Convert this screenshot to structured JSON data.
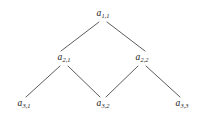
{
  "figure": {
    "type": "lattice-diagram",
    "background_color": "#ffffff",
    "edge_color": "#4a4a4a",
    "label_color": "#1a1a1a",
    "width": 203,
    "height": 131
  },
  "nodes": [
    {
      "id": "a-1-1",
      "base": "a",
      "subscript": "1,1",
      "level": 1,
      "x": 103,
      "y": 14
    },
    {
      "id": "a-2-1",
      "base": "a",
      "subscript": "2,1",
      "level": 2,
      "x": 64,
      "y": 58
    },
    {
      "id": "a-2-2",
      "base": "a",
      "subscript": "2,2",
      "level": 2,
      "x": 142,
      "y": 58
    },
    {
      "id": "a-3-1",
      "base": "a",
      "subscript": "3,1",
      "level": 3,
      "x": 24,
      "y": 104
    },
    {
      "id": "a-3-2",
      "base": "a",
      "subscript": "3,2",
      "level": 3,
      "x": 103,
      "y": 104
    },
    {
      "id": "a-3-3",
      "base": "a",
      "subscript": "3,3",
      "level": 3,
      "x": 182,
      "y": 104
    }
  ],
  "edges": [
    {
      "id": "edge-a11-a21",
      "from": "a-1-1",
      "to": "a-2-1",
      "x1": 99,
      "y1": 22,
      "x2": 61,
      "y2": 51
    },
    {
      "id": "edge-a11-a22",
      "from": "a-1-1",
      "to": "a-2-2",
      "x1": 107,
      "y1": 22,
      "x2": 145,
      "y2": 51
    },
    {
      "id": "edge-a21-a31",
      "from": "a-2-1",
      "to": "a-3-1",
      "x1": 60,
      "y1": 66,
      "x2": 26,
      "y2": 97
    },
    {
      "id": "edge-a21-a32",
      "from": "a-2-1",
      "to": "a-3-2",
      "x1": 68,
      "y1": 66,
      "x2": 100,
      "y2": 97
    },
    {
      "id": "edge-a22-a32",
      "from": "a-2-2",
      "to": "a-3-2",
      "x1": 138,
      "y1": 66,
      "x2": 106,
      "y2": 97
    },
    {
      "id": "edge-a22-a33",
      "from": "a-2-2",
      "to": "a-3-3",
      "x1": 146,
      "y1": 66,
      "x2": 180,
      "y2": 97
    }
  ]
}
